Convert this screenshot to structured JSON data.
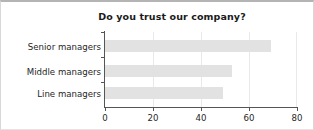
{
  "chart_data": {
    "type": "bar",
    "orientation": "horizontal",
    "title": "Do you trust our company?",
    "xlabel": "",
    "ylabel": "",
    "categories": [
      "Senior managers",
      "Middle managers",
      "Line managers"
    ],
    "values": [
      69,
      53,
      49
    ],
    "series": [
      {
        "name": "Trust",
        "values": [
          69,
          53,
          49
        ]
      }
    ],
    "xlim": [
      0,
      80
    ],
    "xticks": [
      0,
      20,
      40,
      60,
      80
    ],
    "xtick_labels": [
      "0",
      "20",
      "40",
      "60",
      "80"
    ],
    "grid": "vertical",
    "legend": "none",
    "bar_color": "#e2e2e2",
    "axis_color": "#555555",
    "grid_color": "#e9e9e9",
    "text_color": "#262626",
    "background": "#ffffff"
  }
}
